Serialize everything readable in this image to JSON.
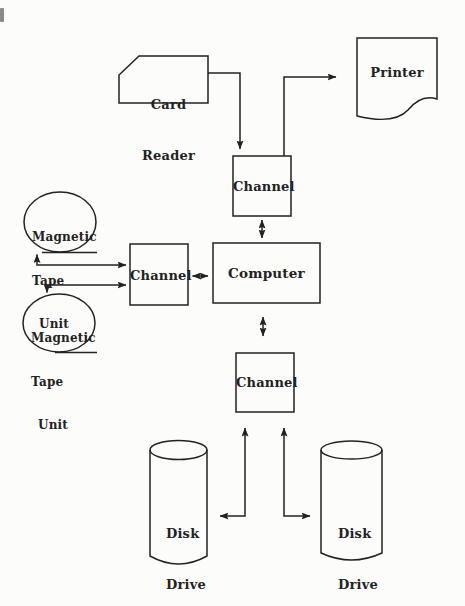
{
  "page": {
    "colors": {
      "ink": "#222222",
      "paper": "#fcfcfa"
    }
  },
  "diagram": {
    "nodes": {
      "card_reader": {
        "shape": "punched-card",
        "lines": [
          "Card",
          "Reader"
        ]
      },
      "printer": {
        "shape": "document",
        "label": "Printer"
      },
      "channel_top": {
        "shape": "rect",
        "label": "Channel"
      },
      "channel_left": {
        "shape": "rect",
        "label": "Channel"
      },
      "channel_bottom": {
        "shape": "rect",
        "label": "Channel"
      },
      "computer": {
        "shape": "rect",
        "label": "Computer"
      },
      "tape_unit_top": {
        "shape": "circle",
        "lines": [
          "Magnetic",
          "Tape",
          "Unit"
        ]
      },
      "tape_unit_bottom": {
        "shape": "circle",
        "lines": [
          "Magnetic",
          "Tape",
          "Unit"
        ]
      },
      "disk_drive_left": {
        "shape": "cylinder",
        "lines": [
          "Disk",
          "Drive"
        ]
      },
      "disk_drive_right": {
        "shape": "cylinder",
        "lines": [
          "Disk",
          "Drive"
        ]
      }
    },
    "edges": [
      {
        "from": "card_reader",
        "to": "channel_top",
        "arrows": "to"
      },
      {
        "from": "channel_top",
        "to": "printer",
        "arrows": "to"
      },
      {
        "from": "channel_top",
        "to": "computer",
        "arrows": "both"
      },
      {
        "from": "channel_left",
        "to": "computer",
        "arrows": "both"
      },
      {
        "from": "tape_unit_top",
        "to": "channel_left",
        "arrows": "both"
      },
      {
        "from": "tape_unit_bottom",
        "to": "channel_left",
        "arrows": "both"
      },
      {
        "from": "computer",
        "to": "channel_bottom",
        "arrows": "both"
      },
      {
        "from": "channel_bottom",
        "to": "disk_drive_left",
        "arrows": "both"
      },
      {
        "from": "channel_bottom",
        "to": "disk_drive_right",
        "arrows": "both"
      }
    ]
  }
}
